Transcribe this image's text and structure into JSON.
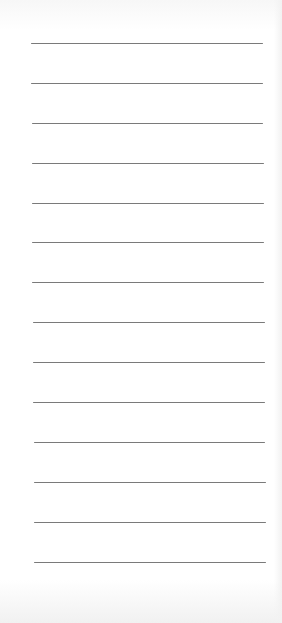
{
  "document": {
    "type": "lined-paper",
    "rule_color": "#7a7a7a",
    "background": "#ffffff",
    "rules": [
      {
        "y": 43,
        "x1": 31,
        "x2": 263
      },
      {
        "y": 83,
        "x1": 31,
        "x2": 263
      },
      {
        "y": 123,
        "x1": 32,
        "x2": 263
      },
      {
        "y": 163,
        "x1": 32,
        "x2": 264
      },
      {
        "y": 203,
        "x1": 32,
        "x2": 264
      },
      {
        "y": 242,
        "x1": 32,
        "x2": 264
      },
      {
        "y": 282,
        "x1": 32,
        "x2": 264
      },
      {
        "y": 322,
        "x1": 33,
        "x2": 265
      },
      {
        "y": 362,
        "x1": 33,
        "x2": 265
      },
      {
        "y": 402,
        "x1": 33,
        "x2": 265
      },
      {
        "y": 442,
        "x1": 34,
        "x2": 265
      },
      {
        "y": 482,
        "x1": 34,
        "x2": 266
      },
      {
        "y": 522,
        "x1": 34,
        "x2": 266
      },
      {
        "y": 562,
        "x1": 34,
        "x2": 266
      }
    ]
  }
}
